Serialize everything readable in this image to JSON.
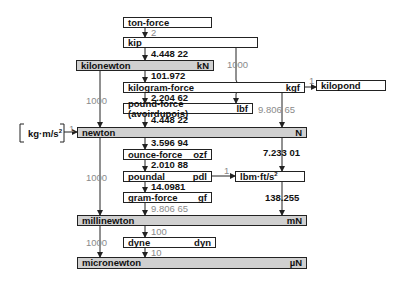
{
  "units": {
    "ton_force": {
      "name": "ton-force",
      "symbol": ""
    },
    "kip": {
      "name": "kip",
      "symbol": ""
    },
    "kilonewton": {
      "name": "kilonewton",
      "symbol": "kN"
    },
    "kilogram_force": {
      "name": "kilogram-force",
      "symbol": "kgf"
    },
    "kilopond": {
      "name": "kilopond",
      "symbol": ""
    },
    "pound_force": {
      "name": "pound-force (avoirdupois)",
      "symbol": "lbf"
    },
    "newton": {
      "name": "newton",
      "symbol": "N"
    },
    "kg_m_s2": {
      "name": "kg·m/s",
      "sup": "2"
    },
    "ounce_force": {
      "name": "ounce-force",
      "symbol": "ozf"
    },
    "poundal": {
      "name": "poundal",
      "symbol": "pdl"
    },
    "lbm_ft_s2": {
      "name": "lbm·ft/s",
      "sup": "2"
    },
    "gram_force": {
      "name": "gram-force",
      "symbol": "gf"
    },
    "millinewton": {
      "name": "millinewton",
      "symbol": "mN"
    },
    "dyne": {
      "name": "dyne",
      "symbol": "dyn"
    },
    "micronewton": {
      "name": "micronewton",
      "symbol": "µN"
    }
  },
  "factors": {
    "ton_to_kip": "2",
    "kip_to_kN": "4.448 22",
    "kip_to_kgf_1000": "1000",
    "kN_to_kgf": "101.972",
    "kgf_to_kilopond": "1",
    "kgf_to_lbf": "2.204 62",
    "kgf_to_N": "9.806 65",
    "lbf_to_N": "4.448 22",
    "kgms2_to_N": "1",
    "kN_to_N": "1000",
    "N_to_ozf": "3.596 94",
    "N_to_lbmfts2": "7.233 01",
    "ozf_to_pdl": "2.010 88",
    "pdl_to_lbmfts2": "1",
    "pdl_to_gf": "14.0981",
    "N_to_mN": "1000",
    "lbmfts2_to_mN": "138.255",
    "gf_to_mN": "9.806 65",
    "mN_to_dyn": "100",
    "mN_to_uN": "1000",
    "dyn_to_uN": "10"
  },
  "colors": {
    "si_box": "#d0d0d0",
    "factor_gray": "#8a8a8a",
    "factor_black": "#111111"
  }
}
